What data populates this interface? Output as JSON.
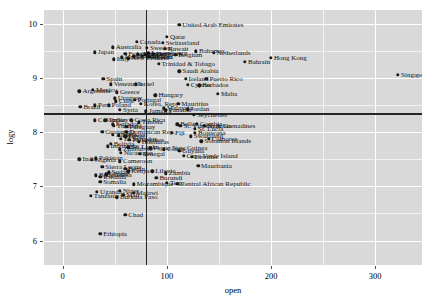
{
  "chart_data": {
    "type": "scatter",
    "title": "",
    "xlabel": "open",
    "ylabel": "logy",
    "xlim": [
      -18,
      345
    ],
    "ylim": [
      5.55,
      10.25
    ],
    "xticks": [
      0,
      100,
      200,
      300
    ],
    "yticks": [
      6,
      7,
      8,
      9,
      10
    ],
    "xtick_labels": [
      "0",
      "100",
      "200",
      "300"
    ],
    "ytick_labels": [
      "6",
      "7",
      "8",
      "9",
      "10"
    ],
    "grid": "white major gridlines on gray panel",
    "legend": "none",
    "reference_lines": [
      {
        "orientation": "vertical",
        "x": 79.5
      },
      {
        "orientation": "horizontal",
        "y": 8.35
      }
    ],
    "points": [
      {
        "label": "United Arab Emirates",
        "x": 112,
        "y": 9.98
      },
      {
        "label": "Qatar",
        "x": 100,
        "y": 9.76
      },
      {
        "label": "Canada",
        "x": 71,
        "y": 9.66
      },
      {
        "label": "Switzerland",
        "x": 96,
        "y": 9.64
      },
      {
        "label": "Australia",
        "x": 48,
        "y": 9.56
      },
      {
        "label": "Sweden",
        "x": 81,
        "y": 9.55
      },
      {
        "label": "Kuwait",
        "x": 98,
        "y": 9.53
      },
      {
        "label": "Bahamas",
        "x": 128,
        "y": 9.49
      },
      {
        "label": "Netherlands",
        "x": 145,
        "y": 9.46
      },
      {
        "label": "Japan",
        "x": 31,
        "y": 9.47
      },
      {
        "label": "Luxembourg",
        "x": 82,
        "y": 9.45
      },
      {
        "label": "Denmark",
        "x": 87,
        "y": 9.44
      },
      {
        "label": "Norway",
        "x": 79,
        "y": 9.43
      },
      {
        "label": "Belgium",
        "x": 108,
        "y": 9.42
      },
      {
        "label": "France",
        "x": 60,
        "y": 9.44
      },
      {
        "label": "Germany",
        "x": 72,
        "y": 9.43
      },
      {
        "label": "Austria",
        "x": 76,
        "y": 9.41
      },
      {
        "label": "Finland",
        "x": 68,
        "y": 9.4
      },
      {
        "label": "Iceland",
        "x": 83,
        "y": 9.39
      },
      {
        "label": "United Kingdom",
        "x": 57,
        "y": 9.38
      },
      {
        "label": "New Zealand",
        "x": 63,
        "y": 9.36
      },
      {
        "label": "Italy",
        "x": 49,
        "y": 9.34
      },
      {
        "label": "Trinidad & Tobago",
        "x": 92,
        "y": 9.26
      },
      {
        "label": "Saudi Arabia",
        "x": 112,
        "y": 9.12
      },
      {
        "label": "Spain",
        "x": 39,
        "y": 8.98
      },
      {
        "label": "Ireland",
        "x": 118,
        "y": 8.98
      },
      {
        "label": "Puerto Rico",
        "x": 138,
        "y": 8.98
      },
      {
        "label": "Venezuela",
        "x": 46,
        "y": 8.88
      },
      {
        "label": "Israel",
        "x": 70,
        "y": 8.88
      },
      {
        "label": "Cyprus",
        "x": 120,
        "y": 8.87
      },
      {
        "label": "Barbados",
        "x": 131,
        "y": 8.86
      },
      {
        "label": "Mexico",
        "x": 29,
        "y": 8.78
      },
      {
        "label": "Argentina",
        "x": 16,
        "y": 8.75
      },
      {
        "label": "Greece",
        "x": 52,
        "y": 8.73
      },
      {
        "label": "Hungary",
        "x": 89,
        "y": 8.68
      },
      {
        "label": "Malta",
        "x": 149,
        "y": 8.7
      },
      {
        "label": "Uruguay",
        "x": 50,
        "y": 8.62
      },
      {
        "label": "Portugal",
        "x": 69,
        "y": 8.6
      },
      {
        "label": "Chile",
        "x": 51,
        "y": 8.57
      },
      {
        "label": "Korea, Rep.",
        "x": 75,
        "y": 8.52
      },
      {
        "label": "Mauritius",
        "x": 111,
        "y": 8.52
      },
      {
        "label": "Peru",
        "x": 31,
        "y": 8.49
      },
      {
        "label": "Poland",
        "x": 44,
        "y": 8.49
      },
      {
        "label": "Brazil",
        "x": 17,
        "y": 8.47
      },
      {
        "label": "Malaysia",
        "x": 97,
        "y": 8.44
      },
      {
        "label": "Jordan",
        "x": 120,
        "y": 8.42
      },
      {
        "label": "Syria",
        "x": 55,
        "y": 8.41
      },
      {
        "label": "Panama",
        "x": 99,
        "y": 8.4
      },
      {
        "label": "Jamaica",
        "x": 80,
        "y": 8.38
      },
      {
        "label": "Seychelles",
        "x": 126,
        "y": 8.32
      },
      {
        "label": "Colombia",
        "x": 31,
        "y": 8.22
      },
      {
        "label": "Turkey",
        "x": 41,
        "y": 8.22
      },
      {
        "label": "Costa Rica",
        "x": 66,
        "y": 8.22
      },
      {
        "label": "Tunisia",
        "x": 73,
        "y": 8.18
      },
      {
        "label": "Gambia",
        "x": 129,
        "y": 8.15
      },
      {
        "label": "Namibia",
        "x": 136,
        "y": 8.11
      },
      {
        "label": "Thailand",
        "x": 49,
        "y": 8.12
      },
      {
        "label": "Ecuador",
        "x": 48,
        "y": 8.14
      },
      {
        "label": "Paraguay",
        "x": 61,
        "y": 8.1
      },
      {
        "label": "St. Vincent & Grenadines",
        "x": 113,
        "y": 8.11
      },
      {
        "label": "St. Lucia",
        "x": 127,
        "y": 8.06
      },
      {
        "label": "Belize",
        "x": 110,
        "y": 8.14
      },
      {
        "label": "Guatemala",
        "x": 38,
        "y": 8.0
      },
      {
        "label": "Dominican Rep.",
        "x": 61,
        "y": 8.0
      },
      {
        "label": "Fiji",
        "x": 105,
        "y": 7.99
      },
      {
        "label": "Botswana",
        "x": 127,
        "y": 7.99
      },
      {
        "label": "Algeria",
        "x": 48,
        "y": 7.95
      },
      {
        "label": "Morocco",
        "x": 54,
        "y": 7.94
      },
      {
        "label": "Egypt",
        "x": 60,
        "y": 7.92
      },
      {
        "label": "Swaziland",
        "x": 123,
        "y": 7.92
      },
      {
        "label": "El Salvador",
        "x": 56,
        "y": 7.88
      },
      {
        "label": "Philippines",
        "x": 64,
        "y": 7.86
      },
      {
        "label": "Comoros",
        "x": 140,
        "y": 7.88
      },
      {
        "label": "Solomon Islands",
        "x": 133,
        "y": 7.83
      },
      {
        "label": "Honduras",
        "x": 73,
        "y": 7.82
      },
      {
        "label": "Bolivia",
        "x": 46,
        "y": 7.78
      },
      {
        "label": "Indonesia",
        "x": 43,
        "y": 7.74
      },
      {
        "label": "Sri Lanka",
        "x": 63,
        "y": 7.72
      },
      {
        "label": "Zimbabwe",
        "x": 55,
        "y": 7.68
      },
      {
        "label": "Papua New Guinea",
        "x": 84,
        "y": 7.7
      },
      {
        "label": "Congo",
        "x": 97,
        "y": 7.68
      },
      {
        "label": "Guyana",
        "x": 112,
        "y": 7.66
      },
      {
        "label": "Senegal",
        "x": 74,
        "y": 7.6
      },
      {
        "label": "Nicaragua",
        "x": 56,
        "y": 7.62
      },
      {
        "label": "Cape Verde Island",
        "x": 116,
        "y": 7.56
      },
      {
        "label": "Lesotho",
        "x": 124,
        "y": 7.54
      },
      {
        "label": "India",
        "x": 16,
        "y": 7.5
      },
      {
        "label": "Nigeria",
        "x": 28,
        "y": 7.49
      },
      {
        "label": "Pakistan",
        "x": 32,
        "y": 7.52
      },
      {
        "label": "Cameroon",
        "x": 55,
        "y": 7.46
      },
      {
        "label": "Sierra Leone",
        "x": 38,
        "y": 7.36
      },
      {
        "label": "Mauritania",
        "x": 130,
        "y": 7.38
      },
      {
        "label": "Benin",
        "x": 60,
        "y": 7.32
      },
      {
        "label": "Kenya",
        "x": 63,
        "y": 7.28
      },
      {
        "label": "Liberia",
        "x": 86,
        "y": 7.28
      },
      {
        "label": "Zambia",
        "x": 99,
        "y": 7.24
      },
      {
        "label": "Sudan",
        "x": 44,
        "y": 7.26
      },
      {
        "label": "Ghana",
        "x": 42,
        "y": 7.22
      },
      {
        "label": "Bangladesh",
        "x": 32,
        "y": 7.2
      },
      {
        "label": "Rwanda",
        "x": 36,
        "y": 7.18
      },
      {
        "label": "Burundi",
        "x": 90,
        "y": 7.16
      },
      {
        "label": "Somalia",
        "x": 36,
        "y": 7.08
      },
      {
        "label": "Mozambique",
        "x": 68,
        "y": 7.04
      },
      {
        "label": "Central African Republic",
        "x": 110,
        "y": 7.05
      },
      {
        "label": "Togo",
        "x": 100,
        "y": 7.06
      },
      {
        "label": "Uganda",
        "x": 33,
        "y": 6.9
      },
      {
        "label": "Niger",
        "x": 55,
        "y": 6.92
      },
      {
        "label": "Malawi",
        "x": 68,
        "y": 6.88
      },
      {
        "label": "Tanzania",
        "x": 27,
        "y": 6.82
      },
      {
        "label": "Mali",
        "x": 58,
        "y": 6.84
      },
      {
        "label": "Burkina Faso",
        "x": 52,
        "y": 6.8
      },
      {
        "label": "Chad",
        "x": 60,
        "y": 6.48
      },
      {
        "label": "Ethiopia",
        "x": 36,
        "y": 6.12
      },
      {
        "label": "Bahrain",
        "x": 175,
        "y": 9.3
      },
      {
        "label": "Hong Kong",
        "x": 200,
        "y": 9.37
      },
      {
        "label": "Singapore",
        "x": 322,
        "y": 9.05
      }
    ]
  },
  "axes": {
    "x_axis_title": "open",
    "y_axis_title": "logy"
  },
  "style": {
    "panel_fill": "#d9d9d9",
    "gridline_color": "#ffffff",
    "point_color": "#1a1a1a",
    "reference_line_color": "#262626",
    "background": "#ffffff"
  }
}
